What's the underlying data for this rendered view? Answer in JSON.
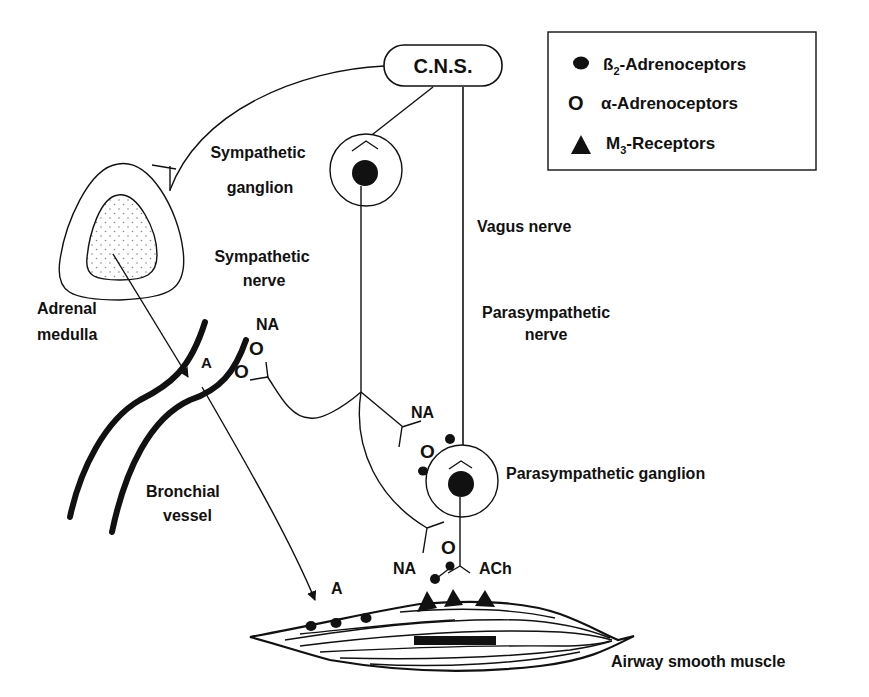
{
  "legend": {
    "items": [
      {
        "symbol": "filled-circle",
        "prefix": "ß",
        "sub": "2",
        "suffix": "-Adrenoceptors",
        "label": "ß2-Adrenoceptors"
      },
      {
        "symbol": "open-circle",
        "prefix": "α-Adrenoceptors",
        "sub": "",
        "suffix": "",
        "label": "α-Adrenoceptors"
      },
      {
        "symbol": "filled-triangle",
        "prefix": "M",
        "sub": "3",
        "suffix": "-Receptors",
        "label": "M3-Receptors"
      }
    ]
  },
  "nodes": {
    "cns": "C.N.S.",
    "sympathetic_ganglion": [
      "Sympathetic",
      "ganglion"
    ],
    "adrenal_medulla": [
      "Adrenal",
      "medulla"
    ],
    "sympathetic_nerve": [
      "Sympathetic",
      "nerve"
    ],
    "vagus_nerve": "Vagus nerve",
    "parasympathetic_nerve": [
      "Parasympathetic",
      "nerve"
    ],
    "parasympathetic_ganglion": "Parasympathetic ganglion",
    "bronchial_vessel": [
      "Bronchial",
      "vessel"
    ],
    "airway_smooth_muscle": "Airway smooth muscle"
  },
  "transmitters": {
    "na_vessel": "NA",
    "a_vessel": "A",
    "na_ganglion": "NA",
    "na_muscle": "NA",
    "ach_muscle": "ACh",
    "a_muscle": "A"
  },
  "colors": {
    "ink": "#111111",
    "background": "#ffffff",
    "stipple": "#888888"
  }
}
